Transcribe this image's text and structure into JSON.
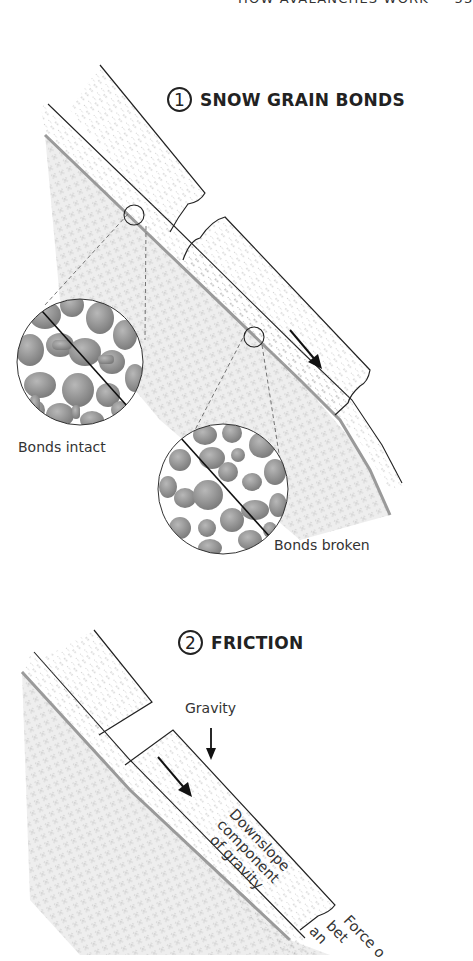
{
  "page": {
    "running_head": "HOW AVALANCHES WORK",
    "page_number": "53"
  },
  "figure1": {
    "number": "1",
    "title": "SNOW GRAIN BONDS",
    "inset_left_label": "Bonds intact",
    "inset_right_label": "Bonds broken"
  },
  "figure2": {
    "number": "2",
    "title": "FRICTION",
    "gravity_label": "Gravity",
    "downslope_label": [
      "Downslope",
      "component",
      "of gravity"
    ],
    "force_label": [
      "Force o",
      "bet",
      "an"
    ]
  },
  "colors": {
    "ink": "#222222",
    "snow_texture": "#9a9a9a",
    "ground": "#bfbfbf",
    "grain": "#8c8c8c"
  }
}
